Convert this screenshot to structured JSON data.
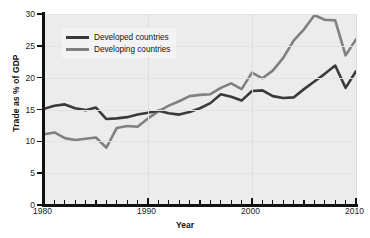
{
  "chart_data": {
    "type": "line",
    "title": "",
    "xlabel": "Year",
    "ylabel": "Trade as % of GDP",
    "xlim": [
      1980,
      2010
    ],
    "ylim": [
      0,
      30
    ],
    "ytick_values": [
      0,
      5,
      10,
      15,
      20,
      25,
      30
    ],
    "ytick_labels": [
      "0",
      "5",
      "10",
      "15",
      "20",
      "25",
      "30"
    ],
    "xtick_values": [
      1980,
      1990,
      2000,
      2010
    ],
    "xtick_labels": [
      "1980",
      "1990",
      "2000",
      "2010"
    ],
    "x_minor_tick_step": 1,
    "grid": true,
    "legend_position": "upper left inside",
    "x": [
      1980,
      1981,
      1982,
      1983,
      1984,
      1985,
      1986,
      1987,
      1988,
      1989,
      1990,
      1991,
      1992,
      1993,
      1994,
      1995,
      1996,
      1997,
      1998,
      1999,
      2000,
      2001,
      2002,
      2003,
      2004,
      2005,
      2006,
      2007,
      2008,
      2009,
      2010
    ],
    "series": [
      {
        "name": "Developed countries",
        "color": "#3a3a3a",
        "values": [
          15.1,
          15.6,
          15.8,
          15.2,
          14.9,
          15.3,
          13.5,
          13.6,
          13.8,
          14.2,
          14.5,
          14.8,
          14.4,
          14.2,
          14.6,
          15.2,
          16.0,
          17.4,
          17.0,
          16.4,
          17.9,
          18.0,
          17.1,
          16.8,
          16.9,
          18.2,
          19.4,
          20.6,
          21.9,
          18.4,
          21.0
        ]
      },
      {
        "name": "Developing countries",
        "color": "#808080",
        "values": [
          11.1,
          11.4,
          10.5,
          10.2,
          10.4,
          10.6,
          9.0,
          12.1,
          12.4,
          12.3,
          13.6,
          14.7,
          15.6,
          16.3,
          17.1,
          17.3,
          17.4,
          18.4,
          19.1,
          18.2,
          20.8,
          19.9,
          21.1,
          23.1,
          25.8,
          27.6,
          29.8,
          29.1,
          29.0,
          23.5,
          26.0
        ]
      }
    ],
    "annotations": []
  },
  "legend": {
    "items": [
      {
        "label": "Developed countries",
        "color": "#3a3a3a"
      },
      {
        "label": "Developing countries",
        "color": "#808080"
      }
    ]
  },
  "colors": {
    "plot_background": "#ececec",
    "page_background": "#ffffff",
    "axis": "#111111",
    "gridline": "#dedede",
    "developed": "#3a3a3a",
    "developing": "#808080"
  }
}
